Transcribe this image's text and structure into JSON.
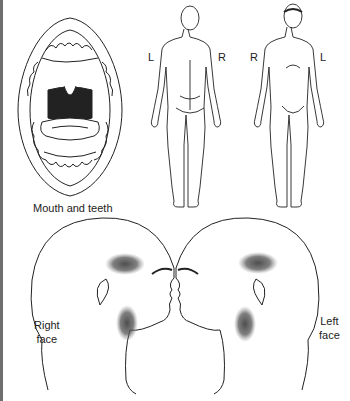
{
  "panels": {
    "mouth": {
      "caption": "Mouth and teeth"
    },
    "body_back": {
      "left_label": "L",
      "right_label": "R"
    },
    "body_front": {
      "left_label": "R",
      "right_label": "L"
    },
    "right_face": {
      "caption_line1": "Right",
      "caption_line2": "face"
    },
    "left_face": {
      "caption_line1": "Left",
      "caption_line2": "face"
    }
  },
  "colors": {
    "line": "#222222",
    "shade": "#555555",
    "frame": "#6e6e6e"
  }
}
